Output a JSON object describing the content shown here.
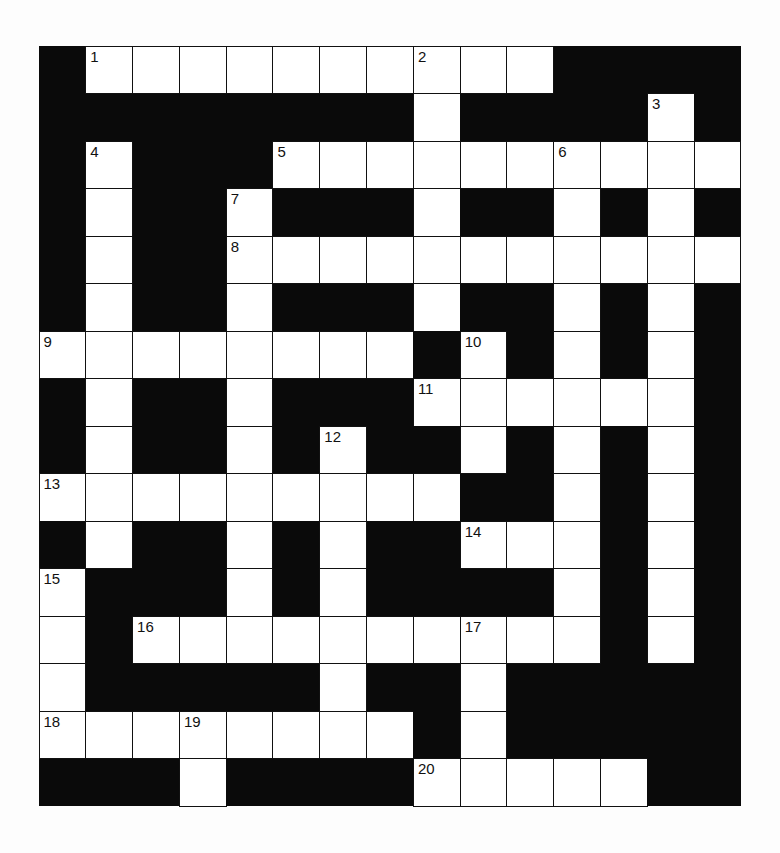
{
  "puzzle": {
    "type": "crossword",
    "rows": 16,
    "cols": 15,
    "colors": {
      "block": "#0a0a0a",
      "cell": "#ffffff",
      "background": "#fdfdfd"
    },
    "grid": [
      "#WWWWWWWWWW####",
      "########W####W#",
      "#W###WWWWWWWWWW",
      "#W##W###W##W#W#",
      "#W##WWWWWWWWWWW",
      "#W##W###W##W#W#",
      "WWWWWWWW#W#W#W#",
      "#W##W###WWWWWW#",
      "#W##W#W##W#W#W#",
      "WWWWWWWWW##W#W#",
      "#W##W#W##WWW#W#",
      "W###W#W####W#W#",
      "W#WWWWWWWWWW#W#",
      "W#####W##W#####",
      "WWWWWWWW#W#####",
      "###W####WWWWW##"
    ],
    "numbers": [
      {
        "label": "1",
        "row": 0,
        "col": 1
      },
      {
        "label": "2",
        "row": 0,
        "col": 8
      },
      {
        "label": "3",
        "row": 1,
        "col": 13
      },
      {
        "label": "4",
        "row": 2,
        "col": 1
      },
      {
        "label": "5",
        "row": 2,
        "col": 5
      },
      {
        "label": "6",
        "row": 2,
        "col": 11
      },
      {
        "label": "7",
        "row": 3,
        "col": 4
      },
      {
        "label": "8",
        "row": 4,
        "col": 4
      },
      {
        "label": "9",
        "row": 6,
        "col": 0
      },
      {
        "label": "10",
        "row": 6,
        "col": 9
      },
      {
        "label": "11",
        "row": 7,
        "col": 8
      },
      {
        "label": "12",
        "row": 8,
        "col": 6
      },
      {
        "label": "13",
        "row": 9,
        "col": 0
      },
      {
        "label": "14",
        "row": 10,
        "col": 9
      },
      {
        "label": "15",
        "row": 11,
        "col": 0
      },
      {
        "label": "16",
        "row": 12,
        "col": 2
      },
      {
        "label": "17",
        "row": 12,
        "col": 9
      },
      {
        "label": "18",
        "row": 14,
        "col": 0
      },
      {
        "label": "19",
        "row": 14,
        "col": 3
      },
      {
        "label": "20",
        "row": 15,
        "col": 8
      }
    ]
  }
}
